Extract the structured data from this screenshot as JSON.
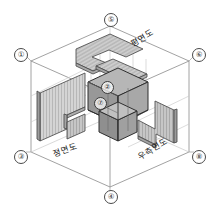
{
  "figure": {
    "title": "",
    "type": "isometric-orthographic-projection-box",
    "background_color": "#ffffff",
    "line_color": "#555555",
    "accent_color": "#8c8c8c"
  },
  "corner_markers": [
    {
      "id": "marker-1",
      "label": "①",
      "x": 14,
      "y": 48
    },
    {
      "id": "marker-5",
      "label": "⑤",
      "x": 104,
      "y": 13
    },
    {
      "id": "marker-6",
      "label": "⑥",
      "x": 192,
      "y": 48
    },
    {
      "id": "marker-3",
      "label": "③",
      "x": 14,
      "y": 150
    },
    {
      "id": "marker-8",
      "label": "⑧",
      "x": 192,
      "y": 150
    },
    {
      "id": "marker-4",
      "label": "④",
      "x": 104,
      "y": 190
    }
  ],
  "object_markers": [
    {
      "id": "marker-2",
      "label": "②",
      "x": 101,
      "y": 81
    },
    {
      "id": "marker-7",
      "label": "⑦",
      "x": 94,
      "y": 97
    }
  ],
  "view_labels": [
    {
      "id": "plan-view",
      "text": "평면도",
      "x": 128,
      "y": 38,
      "rotate": -30
    },
    {
      "id": "front-view",
      "text": "정면도",
      "x": 51,
      "y": 147,
      "rotate": -18
    },
    {
      "id": "right-side-view",
      "text": "우측면도",
      "x": 135,
      "y": 151,
      "rotate": -30
    }
  ],
  "colors": {
    "box_edge": "#777777",
    "hidden_edge": "#b9b9b9",
    "plate_fill": "#d2d2d2",
    "plate_fill_dark": "#bdbdbd",
    "solid_fill": "#9a9a9a",
    "solid_fill_light": "#b5b5b5",
    "solid_fill_top": "#c4c4c4",
    "hatch": "#8e8e8e",
    "projector": "#bfbfbf"
  }
}
